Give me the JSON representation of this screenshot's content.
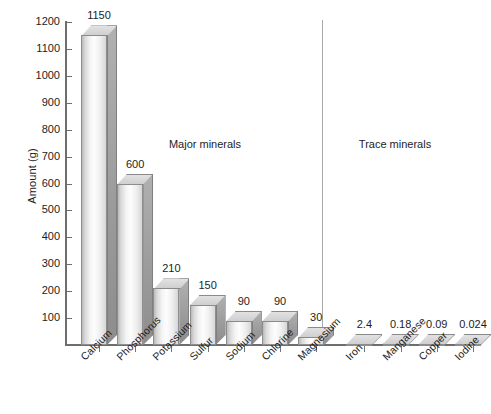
{
  "chart_data": {
    "type": "bar",
    "title": "",
    "xlabel": "",
    "ylabel": "Amount (g)",
    "ylim": [
      0,
      1200
    ],
    "grid": false,
    "legend": "none",
    "categories": [
      "Calcium",
      "Phosphorus",
      "Potassium",
      "Sulfur",
      "Sodium",
      "Chlorine",
      "Magnesium",
      "Iron",
      "Manganese",
      "Copper",
      "Iodine"
    ],
    "values": [
      1150,
      600,
      210,
      150,
      90,
      90,
      30,
      2.4,
      0.18,
      0.09,
      0.024
    ],
    "value_labels": [
      "1150",
      "600",
      "210",
      "150",
      "90",
      "90",
      "30",
      "2.4",
      "0.18",
      "0.09",
      "0.024"
    ],
    "y_ticks": [
      100,
      200,
      300,
      400,
      500,
      600,
      700,
      800,
      900,
      1000,
      1100,
      1200
    ],
    "y_tick_labels": [
      "100",
      "200",
      "300",
      "400",
      "500",
      "600",
      "700",
      "800",
      "900",
      "1000",
      "1100",
      "1200"
    ],
    "groups": [
      {
        "name": "Major minerals",
        "categories": [
          "Calcium",
          "Phosphorus",
          "Potassium",
          "Sulfur",
          "Sodium",
          "Chlorine",
          "Magnesium"
        ]
      },
      {
        "name": "Trace minerals",
        "categories": [
          "Iron",
          "Manganese",
          "Copper",
          "Iodine"
        ]
      }
    ],
    "annotations": [
      "Major minerals",
      "Trace minerals"
    ],
    "colors": {
      "bar_front_light": "#fdfdfd",
      "bar_front_shade": "#d6d6d6",
      "bar_side": "#9a9a9a",
      "bar_top": "#d8d8d8",
      "axis": "#6e6e6e",
      "divider": "#a9a9a9",
      "text": "#1d1d1d",
      "background": "#ffffff"
    }
  },
  "axis": {
    "y_title": "Amount (g)"
  },
  "group_labels": {
    "major": "Major minerals",
    "trace": "Trace minerals"
  }
}
